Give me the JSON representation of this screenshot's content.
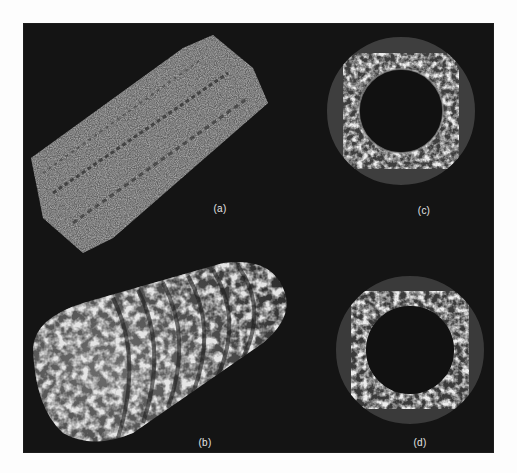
{
  "figure": {
    "background_color": "#141414",
    "page_color": "#fdfdfd",
    "panels": [
      {
        "id": "a",
        "label": "(a)",
        "description": "atomic model of tubular assembly, side view"
      },
      {
        "id": "b",
        "label": "(b)",
        "description": "surface-rendered density map of tube, side view"
      },
      {
        "id": "c",
        "label": "(c)",
        "description": "ring cross-section, end view"
      },
      {
        "id": "d",
        "label": "(d)",
        "description": "ring cross-section, end view"
      }
    ]
  }
}
